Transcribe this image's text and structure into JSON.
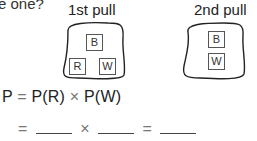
{
  "question_fragment": "e one?",
  "pulls": [
    {
      "label": "1st pull",
      "balls": [
        "B",
        "R",
        "W"
      ]
    },
    {
      "label": "2nd pull",
      "balls": [
        "B",
        "W"
      ]
    }
  ],
  "formula": {
    "lhs": "P",
    "eq": "=",
    "term1": "P(R)",
    "times": "×",
    "term2": "P(W)"
  },
  "blank_line": {
    "eq1": "=",
    "times": "×",
    "eq2": "="
  }
}
